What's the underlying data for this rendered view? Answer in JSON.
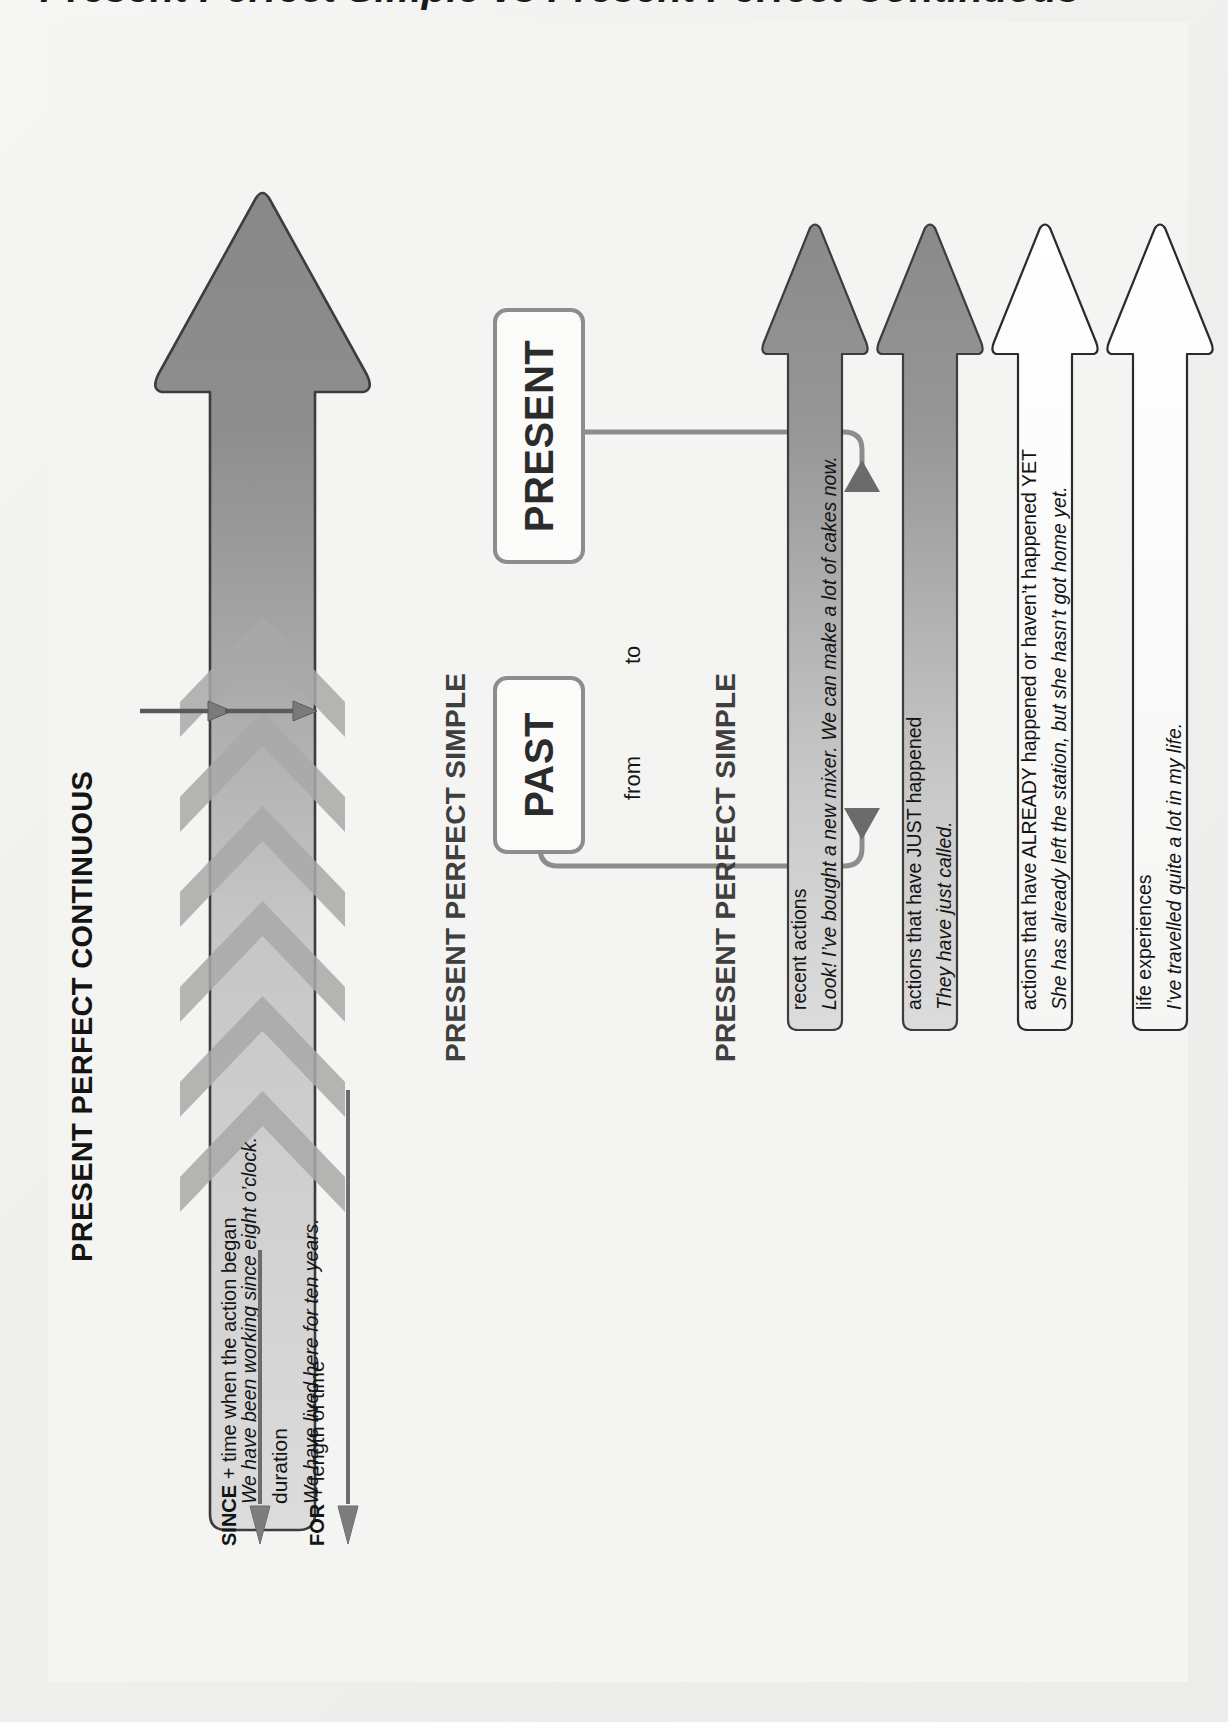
{
  "page": {
    "title_cropped": "Present Perfect Simple vs Present Perfect Continuous",
    "background_color": "#f2f2f0",
    "accent_gray": "#8d8d8d",
    "arrow_dark": "#848484",
    "arrow_light": "#e0e0e0"
  },
  "sections": {
    "continuous": {
      "heading": "PRESENT PERFECT CONTINUOUS",
      "arrow": {
        "name": "continuous-arrow",
        "fill": "gradient-gray",
        "chevrons": 6,
        "lines": [
          {
            "text": "We have been working since eight o’clock.",
            "style": "italic"
          },
          {
            "text": "duration",
            "style": "plain"
          },
          {
            "text": "We have lived here for ten years.",
            "style": "italic"
          }
        ]
      },
      "notes": [
        {
          "prefix": "SINCE",
          "rest": " + time when the action began"
        },
        {
          "prefix": "FOR",
          "rest": " + length of time"
        }
      ]
    },
    "timeline": {
      "heading": "PRESENT PERFECT SIMPLE",
      "from_label": "from",
      "to_label": "to",
      "past_box": "PAST",
      "present_box": "PRESENT"
    },
    "simple": {
      "heading": "PRESENT PERFECT SIMPLE",
      "arrows": [
        {
          "name": "recent-actions-arrow",
          "fill": "gradient-gray",
          "title": "recent actions",
          "example": "Look! I’ve bought a new mixer. We can make a lot of cakes now."
        },
        {
          "name": "just-happened-arrow",
          "fill": "gradient-gray",
          "title": "actions that have JUST happened",
          "example": "They have just called."
        },
        {
          "name": "already-yet-arrow",
          "fill": "white",
          "title": "actions that have ALREADY happened or haven’t happened YET",
          "example": "She has already left the station, but she hasn’t got home yet."
        },
        {
          "name": "life-experiences-arrow",
          "fill": "white",
          "title": "life experiences",
          "example": "I’ve travelled quite a lot in my life."
        }
      ]
    }
  }
}
